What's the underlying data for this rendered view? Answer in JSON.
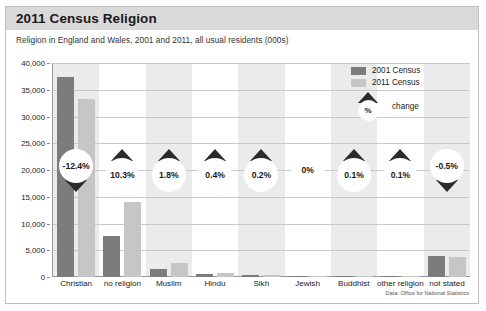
{
  "header": {
    "title": "2011 Census Religion"
  },
  "subtitle": "Religion in England and Wales, 2001 and 2011, all usual residents (000s)",
  "source": "Data: Office for National Statistics",
  "legend": {
    "series_2001": "2001 Census",
    "series_2011": "2011 Census",
    "change_symbol": "%",
    "change_label": "change"
  },
  "colors": {
    "series_2001": "#7c7c7c",
    "series_2011": "#c6c6c6",
    "header_band": "#d9d9d9",
    "band_shaded": "#ebebeb",
    "triangle": "#2b2b2b"
  },
  "chart_data": {
    "type": "bar",
    "title": "2011 Census Religion",
    "subtitle": "Religion in England and Wales, 2001 and 2011, all usual residents (000s)",
    "xlabel": "",
    "ylabel": "",
    "ylim": [
      0,
      40000
    ],
    "ytick_labels": [
      "40,000",
      "35,000",
      "30,000",
      "25,000",
      "20,000",
      "15,000",
      "10,000",
      "5,000",
      "0"
    ],
    "ytick_values": [
      40000,
      35000,
      30000,
      25000,
      20000,
      15000,
      10000,
      5000,
      0
    ],
    "grid": true,
    "legend_position": "top-right",
    "categories": [
      "Christian",
      "no religion",
      "Muslim",
      "Hindu",
      "Sikh",
      "Jewish",
      "Buddhist",
      "other religion",
      "not stated"
    ],
    "series": [
      {
        "name": "2001 Census",
        "values": [
          37300,
          7700,
          1550,
          550,
          330,
          260,
          145,
          150,
          4010
        ]
      },
      {
        "name": "2011 Census",
        "values": [
          33240,
          14100,
          2710,
          820,
          420,
          260,
          248,
          240,
          3800
        ]
      }
    ],
    "annotations": [
      {
        "category": "Christian",
        "label": "-12.4%",
        "direction": "down"
      },
      {
        "category": "no religion",
        "label": "10.3%",
        "direction": "up"
      },
      {
        "category": "Muslim",
        "label": "1.8%",
        "direction": "up"
      },
      {
        "category": "Hindu",
        "label": "0.4%",
        "direction": "up"
      },
      {
        "category": "Sikh",
        "label": "0.2%",
        "direction": "up"
      },
      {
        "category": "Jewish",
        "label": "0%",
        "direction": "none"
      },
      {
        "category": "Buddhist",
        "label": "0.1%",
        "direction": "up"
      },
      {
        "category": "other religion",
        "label": "0.1%",
        "direction": "up"
      },
      {
        "category": "not stated",
        "label": "-0.5%",
        "direction": "down"
      }
    ]
  }
}
